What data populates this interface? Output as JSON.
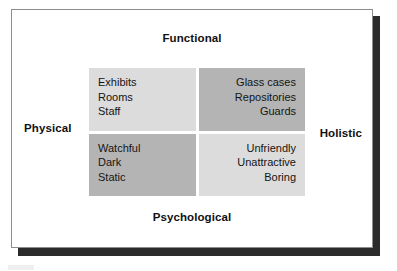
{
  "figure": {
    "type": "2x2-matrix-diagram",
    "axes": {
      "top_label": "Functional",
      "bottom_label": "Psychological",
      "left_label": "Physical",
      "right_label": "Holistic"
    },
    "quadrants": [
      {
        "position": "top-left",
        "shade": "light",
        "color": "#dcdcdc",
        "align": "left",
        "items": [
          "Exhibits",
          "Rooms",
          "Staff"
        ]
      },
      {
        "position": "top-right",
        "shade": "medium",
        "color": "#b4b4b4",
        "align": "right",
        "items": [
          "Glass cases",
          "Repositories",
          "Guards"
        ]
      },
      {
        "position": "bottom-left",
        "shade": "medium",
        "color": "#b4b4b4",
        "align": "left",
        "items": [
          "Watchful",
          "Dark",
          "Static"
        ]
      },
      {
        "position": "bottom-right",
        "shade": "light",
        "color": "#dcdcdc",
        "align": "right",
        "items": [
          "Unfriendly",
          "Unattractive",
          "Boring"
        ]
      }
    ],
    "colors": {
      "background": "#ffffff",
      "frame_border": "#8d8d8d",
      "shadow": "#2b2b2b",
      "text": "#111111",
      "cell_light": "#dcdcdc",
      "cell_medium": "#b4b4b4"
    }
  }
}
